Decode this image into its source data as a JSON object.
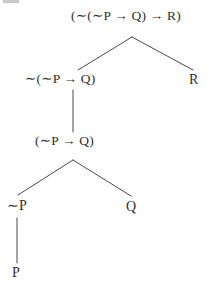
{
  "diagram": {
    "type": "parse-tree",
    "background_color": "#ffffff",
    "text_color": "#2f2f2f",
    "edge_color": "#4a4a4a",
    "nodes": [
      {
        "id": "root",
        "label": "(∼(∼P → Q) → R)",
        "level": 0,
        "x": 133,
        "y": 16
      },
      {
        "id": "left1",
        "label": "∼(∼P → Q)",
        "level": 1,
        "x": 74,
        "y": 79
      },
      {
        "id": "right1",
        "label": "R",
        "level": 1,
        "x": 194,
        "y": 80
      },
      {
        "id": "left2",
        "label": "(∼P → Q)",
        "level": 2,
        "x": 74,
        "y": 141
      },
      {
        "id": "notp",
        "label": "∼P",
        "level": 3,
        "x": 20,
        "y": 206
      },
      {
        "id": "q",
        "label": "Q",
        "level": 3,
        "x": 131,
        "y": 207
      },
      {
        "id": "p",
        "label": "P",
        "level": 4,
        "x": 17,
        "y": 273
      }
    ],
    "edges": [
      {
        "from": "root",
        "to": "left1"
      },
      {
        "from": "root",
        "to": "right1"
      },
      {
        "from": "left1",
        "to": "left2"
      },
      {
        "from": "left2",
        "to": "notp"
      },
      {
        "from": "left2",
        "to": "q"
      },
      {
        "from": "notp",
        "to": "p"
      }
    ]
  }
}
